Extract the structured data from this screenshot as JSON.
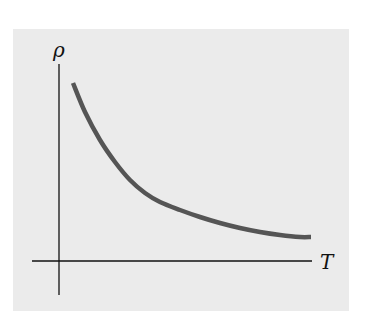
{
  "chart_data": {
    "type": "line",
    "title": "",
    "xlabel": "T",
    "ylabel": "ρ",
    "grid": false,
    "legend": null,
    "x_ticks": [],
    "y_ticks": [],
    "series": [
      {
        "name": "ρ(T)",
        "color": "#555555",
        "points_px": [
          [
            73,
            83
          ],
          [
            85,
            112
          ],
          [
            100,
            140
          ],
          [
            115,
            162
          ],
          [
            130,
            180
          ],
          [
            145,
            193
          ],
          [
            160,
            202
          ],
          [
            180,
            210
          ],
          [
            200,
            217
          ],
          [
            220,
            223
          ],
          [
            240,
            228
          ],
          [
            260,
            232
          ],
          [
            280,
            235
          ],
          [
            300,
            237
          ],
          [
            311,
            237
          ]
        ]
      }
    ]
  },
  "colors": {
    "background": "#ffffff",
    "panel": "#ebebeb",
    "axis": "#111111",
    "curve": "#555555"
  }
}
